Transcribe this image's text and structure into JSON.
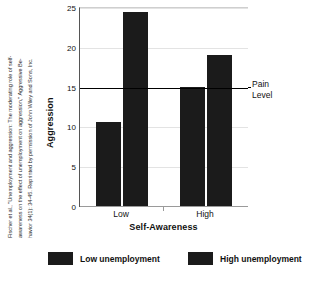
{
  "citation": {
    "line1": "Fischer et al., \"Unemployment and aggression: The moderating role of self-",
    "line2": "awareness on the effect of unemployment on aggression,\" Aggressive Be-",
    "line3": "havior 34(1): 34-45.  Reprinted by permission of John Wiley and Sons, Inc."
  },
  "chart_data": {
    "type": "bar",
    "title": "",
    "xlabel": "Self-Awareness",
    "ylabel": "Aggression",
    "categories": [
      "Low",
      "High"
    ],
    "ylim": [
      0,
      25
    ],
    "yticks": [
      0,
      5,
      10,
      15,
      20,
      25
    ],
    "grid": true,
    "legend_position": "bottom",
    "series": [
      {
        "name": "Low unemployment",
        "values": [
          10.6,
          14.9
        ],
        "color": "#1b1b1b"
      },
      {
        "name": "High unemployment",
        "values": [
          24.4,
          19.0
        ],
        "color": "#1b1b1b"
      }
    ],
    "annotations": [
      {
        "name": "pain-level",
        "label_line1": "Pain",
        "label_line2": "Level",
        "y": 15
      }
    ]
  }
}
